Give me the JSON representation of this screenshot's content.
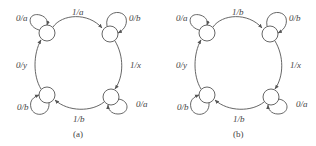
{
  "figure": {
    "background": "#ffffff",
    "line_color": "#555555",
    "text_color": "#444444",
    "diagrams": [
      {
        "caption": "(a)",
        "states": [
          "top-left",
          "top-right",
          "bottom-right",
          "bottom-left"
        ],
        "transitions": {
          "top_left_self": "0/a",
          "top_left_to_top_right": "1/a",
          "top_right_self": "0/b",
          "top_right_to_bottom_right": "1/x",
          "bottom_right_self": "0/a",
          "bottom_right_to_bottom_left": "1/b",
          "bottom_left_self": "0/b",
          "bottom_left_to_top_left": "0/y"
        }
      },
      {
        "caption": "(b)",
        "states": [
          "top-left",
          "top-right",
          "bottom-right",
          "bottom-left"
        ],
        "transitions": {
          "top_left_self": "0/a",
          "top_left_to_top_right": "1/b",
          "top_right_self": "0/b",
          "top_right_to_bottom_right": "1/x",
          "bottom_right_self": "0/a",
          "bottom_right_to_bottom_left": "1/b",
          "bottom_left_self": "0/b",
          "bottom_left_to_top_left": "0/y"
        }
      }
    ]
  }
}
